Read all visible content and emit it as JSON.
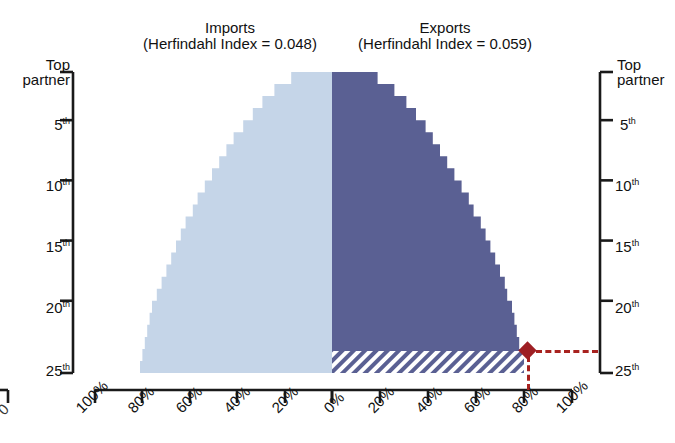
{
  "top_cut_text": "· · ·   ·   · · ·      ·        ·            ·",
  "titles": {
    "imports": {
      "line1": "Imports",
      "line2": "(Herfindahl Index = 0.048)"
    },
    "exports": {
      "line1": "Exports",
      "line2": "(Herfindahl Index = 0.059)"
    }
  },
  "axes": {
    "y_left": {
      "top_label_line1": "Top",
      "top_label_line2": "partner",
      "ticks": [
        "5",
        "10",
        "15",
        "20",
        "25"
      ],
      "ordinal_suffix": "th"
    },
    "y_right": {
      "top_label_line1": "Top",
      "top_label_line2": "partner",
      "ticks": [
        "5",
        "10",
        "15",
        "20",
        "25"
      ],
      "ordinal_suffix": "th"
    },
    "x_left_ticks": [
      "100%",
      "80%",
      "60%",
      "40%",
      "20%",
      "0%"
    ],
    "x_right_ticks": [
      "0%",
      "20%",
      "40%",
      "60%",
      "80%",
      "100%"
    ],
    "x_left_cut_tick": "0"
  },
  "colors": {
    "imports_fill": "#c5d5e8",
    "exports_fill": "#5a6093",
    "marker": "#9e1f24",
    "dash": "#a8221f",
    "axis": "#1a1a1a",
    "hatch_stripe": "#5a6093",
    "hatch_bg": "#ffffff"
  },
  "chart_data": {
    "type": "area",
    "subtitle": "Imports (Herfindahl Index = 0.048) vs Exports (Herfindahl Index = 0.059)",
    "xlabel": "Cumulative share of trade (%)",
    "ylabel": "Partner rank",
    "orientation": "horizontal-mirrored",
    "grid": false,
    "legend_position": "none",
    "ylim": [
      1,
      25
    ],
    "xlim": [
      0,
      100
    ],
    "y_ticks": [
      1,
      5,
      10,
      15,
      20,
      25
    ],
    "y_tick_labels": [
      "Top partner",
      "5th",
      "10th",
      "15th",
      "20th",
      "25th"
    ],
    "x_ticks": [
      0,
      20,
      40,
      60,
      80,
      100
    ],
    "x_tick_labels_left": [
      "100%",
      "80%",
      "60%",
      "40%",
      "20%",
      "0%"
    ],
    "x_tick_labels_right": [
      "0%",
      "20%",
      "40%",
      "60%",
      "80%",
      "100%"
    ],
    "ranks": [
      1,
      2,
      3,
      4,
      5,
      6,
      7,
      8,
      9,
      10,
      11,
      12,
      13,
      14,
      15,
      16,
      17,
      18,
      19,
      20,
      21,
      22,
      23,
      24,
      25
    ],
    "series": [
      {
        "name": "Imports",
        "direction": "left",
        "herfindahl_index": 0.048,
        "fill": "#c5d5e8",
        "hatched_extension": false,
        "cumulative_share_pct": [
          17,
          24,
          29,
          33,
          37,
          41,
          44,
          47,
          50,
          53,
          56,
          58,
          61,
          63,
          65,
          67,
          69,
          71,
          73,
          75,
          76,
          77,
          78,
          79,
          80
        ]
      },
      {
        "name": "Exports",
        "direction": "right",
        "herfindahl_index": 0.059,
        "fill": "#5a6093",
        "hatched_extension": true,
        "cumulative_share_pct": [
          19,
          26,
          31,
          35,
          39,
          42,
          45,
          48,
          51,
          54,
          57,
          59,
          62,
          64,
          66,
          68,
          70,
          72,
          73,
          75,
          76,
          77,
          78,
          79,
          80
        ]
      }
    ],
    "annotations": [
      {
        "type": "diamond-marker",
        "label": "",
        "series": "Exports",
        "rank": 25,
        "value_pct": 80
      },
      {
        "type": "dashed-leader-horizontal",
        "from_pct": 80,
        "to_axis": "right"
      },
      {
        "type": "dashed-leader-vertical",
        "at_pct": 80,
        "to_axis": "bottom"
      }
    ]
  }
}
